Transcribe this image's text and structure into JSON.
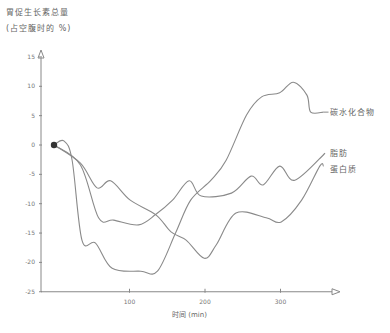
{
  "chart_data": {
    "type": "line",
    "title": "胃促生长素总量",
    "subtitle": "(占空腹时的 %)",
    "xlabel": "时间 (min)",
    "ylabel": "胃促生长素总量 (占空腹时的 %)",
    "xlim": [
      0,
      380
    ],
    "ylim": [
      -25,
      17
    ],
    "x_ticks": [
      100,
      200,
      300
    ],
    "x_tick_labels": [
      "100",
      "200",
      "300"
    ],
    "y_ticks": [
      15,
      10,
      5,
      0,
      -5,
      -10,
      -15,
      -20,
      -25
    ],
    "y_tick_labels": [
      "15",
      "10",
      "5",
      "0",
      "-5",
      "-10",
      "-15",
      "-20",
      "-25"
    ],
    "grid": false,
    "legend_position": "inline-right",
    "start_marker": {
      "x": 0,
      "y": 0
    },
    "series": [
      {
        "name": "碳水化合物",
        "x": [
          0,
          13,
          24,
          37,
          55,
          77,
          115,
          137,
          161,
          181,
          208,
          228,
          255,
          275,
          299,
          317,
          335,
          340,
          357
        ],
        "values": [
          0,
          0.7,
          -2.6,
          -16.2,
          -16.7,
          -21,
          -21.5,
          -21.5,
          -15,
          -9.4,
          -6,
          -2.6,
          5.1,
          8.2,
          8.9,
          10.7,
          8.5,
          5.6,
          5.6
        ]
      },
      {
        "name": "脂肪",
        "x": [
          0,
          35,
          59,
          79,
          112,
          135,
          157,
          179,
          195,
          235,
          261,
          277,
          299,
          319,
          359
        ],
        "values": [
          0,
          -3.4,
          -12.4,
          -12.8,
          -13.6,
          -11.8,
          -9.4,
          -6.1,
          -8.7,
          -8.2,
          -5.3,
          -6.8,
          -3.6,
          -6,
          -1.4
        ]
      },
      {
        "name": "蛋白质",
        "x": [
          0,
          35,
          57,
          75,
          101,
          135,
          155,
          175,
          199,
          215,
          241,
          281,
          301,
          328,
          352,
          357
        ],
        "values": [
          0,
          -3.1,
          -7.3,
          -6.1,
          -9.4,
          -11.9,
          -14.8,
          -16.2,
          -19.3,
          -17,
          -11.6,
          -12.4,
          -13.1,
          -9.4,
          -3.6,
          -3.6
        ]
      }
    ]
  },
  "labels": {
    "title_line1": "胃促生长素总量",
    "title_line2": "(占空腹时的 %)",
    "xlabel": "时间 (min)",
    "carb": "碳水化合物",
    "fat": "脂肪",
    "protein": "蛋白质"
  },
  "colors": {
    "line": "#8a8a8a",
    "axis": "#888888",
    "marker": "#333333"
  }
}
